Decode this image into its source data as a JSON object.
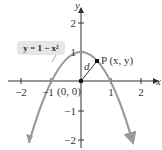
{
  "figure": {
    "equation_label": "y = 1 − x²",
    "point_label": "P (x, y)",
    "origin_label": "(0, 0)",
    "distance_label": "d",
    "x_axis_label": "x",
    "y_axis_label": "y",
    "x_ticks": [
      "−2",
      "−1",
      "1",
      "2"
    ],
    "y_ticks": [
      "2",
      "1",
      "−1",
      "−2"
    ],
    "colors": {
      "curve": "#999999",
      "axes": "#333333",
      "callout_bg": "#e8e8e8",
      "point": "#111111"
    }
  }
}
